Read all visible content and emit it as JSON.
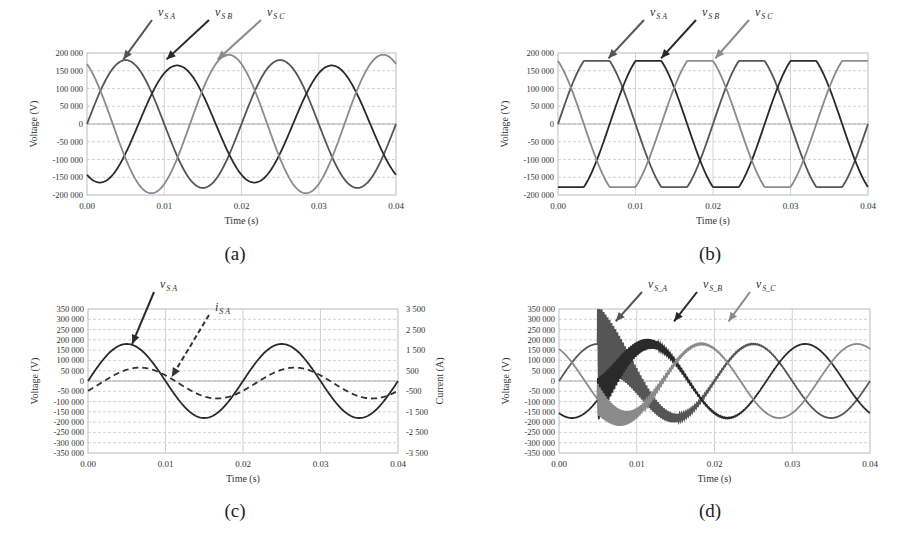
{
  "figure": {
    "captions": [
      "(a)",
      "(b)",
      "(c)",
      "(d)"
    ]
  },
  "colors": {
    "phase_a": "#555555",
    "phase_b": "#2a2a2a",
    "phase_c": "#8a8a8a",
    "current": "#333333",
    "grid": "#c8c8c8",
    "axis": "#bbbbbb"
  },
  "chart_data": [
    {
      "id": "a",
      "type": "line",
      "caption": "(a)",
      "title": "",
      "xlabel": "Time  (s)",
      "ylabel": "Voltage (V)",
      "xlim": [
        0,
        0.04
      ],
      "ylim": [
        -200000,
        200000
      ],
      "xticks": [
        "0.00",
        "0.01",
        "0.02",
        "0.03",
        "0.04"
      ],
      "yticks": [
        "200 000",
        "150 000",
        "100 000",
        "50 000",
        "0",
        "-50 000",
        "-100 000",
        "-150 000",
        "-200 000"
      ],
      "grid": true,
      "frequency_hz": 50,
      "series": [
        {
          "name": "vS_A",
          "label": "v",
          "sub": "S A",
          "amplitude": 180000,
          "phase_deg": 0,
          "style": "solid",
          "color_key": "phase_a"
        },
        {
          "name": "vS_B",
          "label": "v",
          "sub": "S B",
          "amplitude": 165000,
          "phase_deg": -120,
          "style": "solid",
          "color_key": "phase_b"
        },
        {
          "name": "vS_C",
          "label": "v",
          "sub": "S C",
          "amplitude": 195000,
          "phase_deg": 120,
          "style": "solid",
          "color_key": "phase_c"
        }
      ],
      "annotations": [
        {
          "text": "vS_A",
          "arrow_to_t": 0.0047,
          "arrow_to_v": 182000
        },
        {
          "text": "vS_B",
          "arrow_to_t": 0.0103,
          "arrow_to_v": 182000
        },
        {
          "text": "vS_C",
          "arrow_to_t": 0.0169,
          "arrow_to_v": 182000
        }
      ]
    },
    {
      "id": "b",
      "type": "line",
      "caption": "(b)",
      "title": "",
      "xlabel": "Time  (s)",
      "ylabel": "Voltage (V)",
      "xlim": [
        0,
        0.04
      ],
      "ylim": [
        -200000,
        200000
      ],
      "xticks": [
        "0.00",
        "0.01",
        "0.02",
        "0.03",
        "0.04"
      ],
      "yticks": [
        "200 000",
        "150 000",
        "100 000",
        "50 000",
        "0",
        "-50 000",
        "-100 000",
        "-150 000",
        "-200 000"
      ],
      "grid": true,
      "frequency_hz": 50,
      "waveform": "flat-topped (saturated) sine, clipped near ±175 000 V",
      "series": [
        {
          "name": "vS_A",
          "label": "v",
          "sub": "S A",
          "amplitude": 205000,
          "clip": 178000,
          "phase_deg": 0,
          "style": "solid",
          "color_key": "phase_a"
        },
        {
          "name": "vS_B",
          "label": "v",
          "sub": "S B",
          "amplitude": 205000,
          "clip": 178000,
          "phase_deg": -120,
          "style": "solid",
          "color_key": "phase_b"
        },
        {
          "name": "vS_C",
          "label": "v",
          "sub": "S C",
          "amplitude": 205000,
          "clip": 178000,
          "phase_deg": 120,
          "style": "solid",
          "color_key": "phase_c"
        }
      ],
      "annotations": [
        {
          "text": "vS_A",
          "arrow_to_t": 0.0065,
          "arrow_to_v": 185000
        },
        {
          "text": "vS_B",
          "arrow_to_t": 0.0133,
          "arrow_to_v": 185000
        },
        {
          "text": "vS_C",
          "arrow_to_t": 0.0203,
          "arrow_to_v": 185000
        }
      ]
    },
    {
      "id": "c",
      "type": "line",
      "caption": "(c)",
      "title": "",
      "xlabel": "Time  (s)",
      "ylabel": "Voltage (V)",
      "y2label": "Current  (A)",
      "xlim": [
        0,
        0.04
      ],
      "ylim": [
        -350000,
        350000
      ],
      "y2lim": [
        -3500,
        3500
      ],
      "xticks": [
        "0.00",
        "0.01",
        "0.02",
        "0.03",
        "0.04"
      ],
      "yticks": [
        "350 000",
        "300 000",
        "250 000",
        "200 000",
        "150 000",
        "100 000",
        "50 000",
        "0",
        "-50 000",
        "-100 000",
        "-150 000",
        "-200 000",
        "-250 000",
        "-300 000",
        "-350 000"
      ],
      "y2ticks": [
        "3 500",
        "2 500",
        "1 500",
        "500",
        "-500",
        "-1 500",
        "-2 500",
        "-3 500"
      ],
      "grid": true,
      "frequency_hz": 50,
      "series": [
        {
          "name": "vS_A",
          "label": "v",
          "sub": "S A",
          "axis": "left",
          "amplitude": 180000,
          "phase_deg": 0,
          "style": "solid",
          "color_key": "phase_b"
        },
        {
          "name": "iS_A",
          "label": "i",
          "sub": "S A",
          "axis": "right",
          "amplitude": 750,
          "offset": -100,
          "phase_deg": -30,
          "style": "dashed",
          "color_key": "current"
        }
      ],
      "annotations": [
        {
          "text": "vS_A",
          "arrow_to_t": 0.0057,
          "arrow_to_v": 180000
        },
        {
          "text": "iS_A",
          "arrow_to_t": 0.0108,
          "arrow_to_v": 20000
        }
      ]
    },
    {
      "id": "d",
      "type": "line",
      "caption": "(d)",
      "title": "",
      "xlabel": "Time  (s)",
      "ylabel": "Voltage (V)",
      "xlim": [
        0,
        0.04
      ],
      "ylim": [
        -350000,
        350000
      ],
      "xticks": [
        "0.00",
        "0.01",
        "0.02",
        "0.03",
        "0.04"
      ],
      "yticks": [
        "350 000",
        "300 000",
        "250 000",
        "200 000",
        "150 000",
        "100 000",
        "50 000",
        "0",
        "-50 000",
        "-100 000",
        "-150 000",
        "-200 000",
        "-250 000",
        "-300 000",
        "-350 000"
      ],
      "grid": true,
      "frequency_hz": 50,
      "transient": {
        "start_t": 0.005,
        "description": "high-frequency oscillation after switching at t=0.005 s, peak ≈ 340 000 V, decaying by t≈0.025 s",
        "osc_freq_hz": 4000,
        "peak_v": 340000,
        "decay_tau_s": 0.0045
      },
      "series": [
        {
          "name": "vS_A",
          "label": "v",
          "sub": "S_A",
          "amplitude": 180000,
          "phase_deg": 0,
          "style": "solid",
          "color_key": "phase_a"
        },
        {
          "name": "vS_B",
          "label": "v",
          "sub": "S_B",
          "amplitude": 180000,
          "phase_deg": -120,
          "style": "solid",
          "color_key": "phase_b"
        },
        {
          "name": "vS_C",
          "label": "v",
          "sub": "S_C",
          "amplitude": 180000,
          "phase_deg": 120,
          "style": "solid",
          "color_key": "phase_c"
        }
      ],
      "annotations": [
        {
          "text": "vS_A",
          "arrow_to_t": 0.0073,
          "arrow_to_v": 290000
        },
        {
          "text": "vS_B",
          "arrow_to_t": 0.0148,
          "arrow_to_v": 290000
        },
        {
          "text": "vS_C",
          "arrow_to_t": 0.0218,
          "arrow_to_v": 290000
        }
      ]
    }
  ]
}
